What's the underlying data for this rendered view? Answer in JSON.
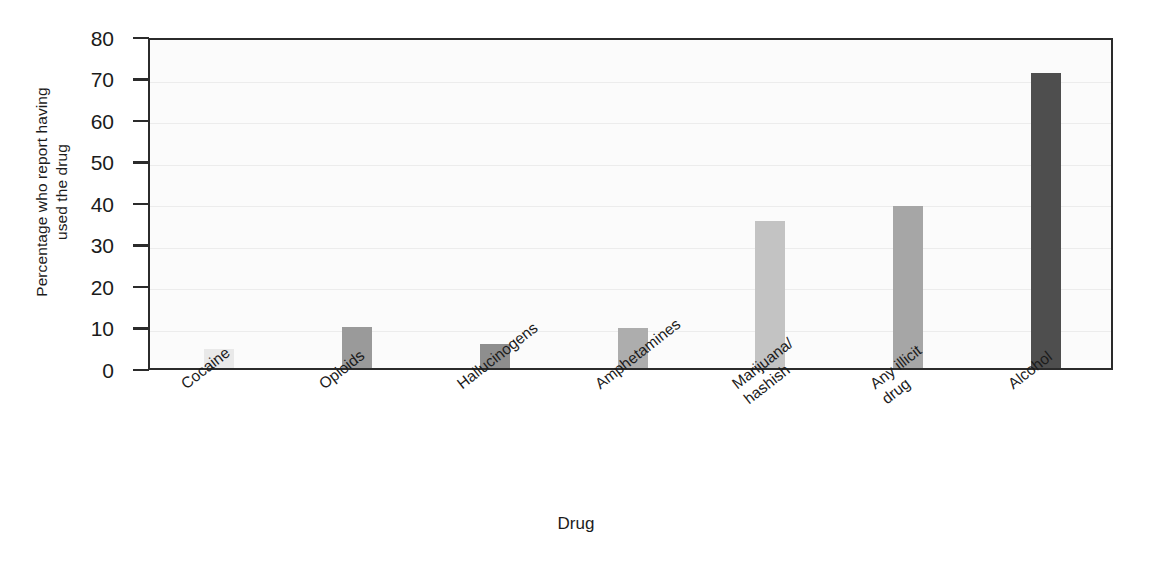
{
  "chart_data": {
    "type": "bar",
    "title": "",
    "xlabel": "Drug",
    "ylabel": "Percentage who report having used the drug",
    "ylabel_lines": [
      "Percentage who report having",
      "used the drug"
    ],
    "categories": [
      "Cocaine",
      "Opioids",
      "Hallucinogens",
      "Amphetamines",
      "Marijuana/hashish",
      "Any illicit drug",
      "Alcohol"
    ],
    "category_lines": [
      [
        "Cocaine"
      ],
      [
        "Opioids"
      ],
      [
        "Hallucinogens"
      ],
      [
        "Amphetamines"
      ],
      [
        "Marijuana/",
        "hashish"
      ],
      [
        "Any illicit",
        "drug"
      ],
      [
        "Alcohol"
      ]
    ],
    "values": [
      4.5,
      10,
      5.8,
      9.7,
      35.5,
      39,
      71
    ],
    "bar_colors": [
      "#e9e9e9",
      "#9a9a9a",
      "#8e8e8e",
      "#adadad",
      "#c3c3c3",
      "#a6a6a6",
      "#4e4e4e"
    ],
    "ylim": [
      0,
      80
    ],
    "yticks": [
      0,
      10,
      20,
      30,
      40,
      50,
      60,
      70,
      80
    ],
    "ytick_labels": [
      "0",
      "10",
      "20",
      "30",
      "40",
      "50",
      "60",
      "70",
      "80"
    ],
    "grid": true,
    "grid_axis": "y",
    "legend": null,
    "axis_color": "#2b2b2b",
    "plot_background": "#fbfbfb"
  }
}
